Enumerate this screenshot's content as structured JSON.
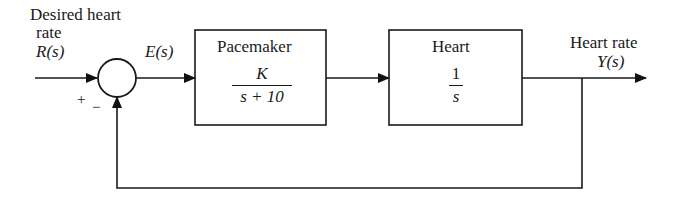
{
  "diagram": {
    "type": "feedback-control-block-diagram",
    "input": {
      "label_line1": "Desired heart",
      "label_line2": "rate",
      "signal": "R(s)"
    },
    "summing_junction": {
      "plus_sign": "+",
      "minus_sign": "−"
    },
    "error_signal": "E(s)",
    "blocks": [
      {
        "title": "Pacemaker",
        "numerator": "K",
        "denominator": "s + 10"
      },
      {
        "title": "Heart",
        "numerator": "1",
        "denominator": "s"
      }
    ],
    "output": {
      "label": "Heart rate",
      "signal": "Y(s)"
    },
    "feedback": "unity negative feedback"
  }
}
